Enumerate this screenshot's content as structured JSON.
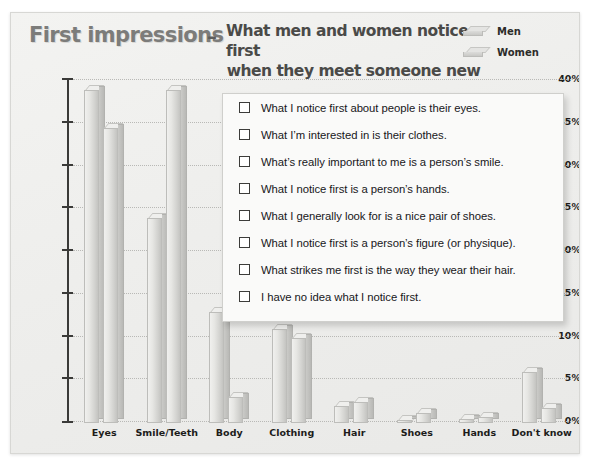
{
  "header": {
    "title_keyword": "First impressions",
    "title_dash": "–",
    "title_line1": "What men and women notice first",
    "title_line2": "when they meet someone new"
  },
  "legend": {
    "items": [
      {
        "label": "Men",
        "icon": "bar-swatch-icon",
        "color": "#dcdcda"
      },
      {
        "label": "Women",
        "icon": "bar-swatch-icon",
        "color": "#cacac7"
      }
    ]
  },
  "panel": {
    "options": [
      "What I notice first about people is their eyes.",
      "What I’m interested in is their clothes.",
      "What’s really important to me is a person’s smile.",
      "What I notice first is a person’s hands.",
      "What I generally look for is a nice pair of shoes.",
      "What I notice first is a person’s figure (or physique).",
      "What strikes me first is the way they wear their hair.",
      "I have no idea what I notice first."
    ]
  },
  "chart_data": {
    "type": "bar",
    "title": "First impressions – What men and women notice first when they meet someone new",
    "xlabel": "",
    "ylabel": "",
    "ylim": [
      0,
      40
    ],
    "ytick_labels": [
      "0%",
      "5%",
      "10%",
      "15%",
      "20%",
      "25%",
      "30%",
      "35%",
      "40%"
    ],
    "ytick_values": [
      0,
      5,
      10,
      15,
      20,
      25,
      30,
      35,
      40
    ],
    "grid": true,
    "legend_position": "top-right",
    "categories": [
      "Eyes",
      "Smile/Teeth",
      "Body",
      "Clothing",
      "Hair",
      "Shoes",
      "Hands",
      "Don't know"
    ],
    "series": [
      {
        "name": "Men",
        "values": [
          39.0,
          24.0,
          13.0,
          11.0,
          2.0,
          0.3,
          0.5,
          6.0
        ]
      },
      {
        "name": "Women",
        "values": [
          34.5,
          39.0,
          3.0,
          10.0,
          2.5,
          1.2,
          0.7,
          1.8
        ]
      }
    ]
  }
}
